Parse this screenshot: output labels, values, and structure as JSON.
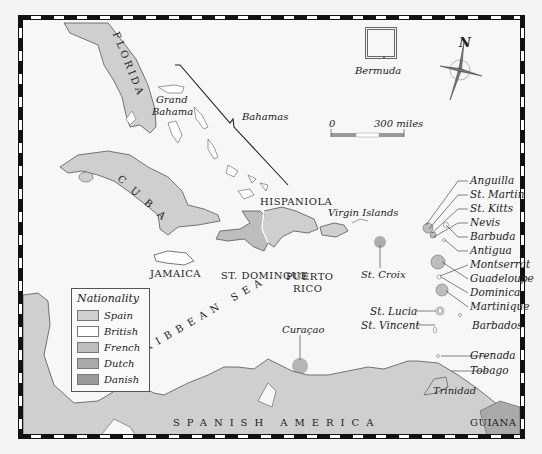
{
  "map": {
    "title": "Caribbean Colonial Nationality Map",
    "regions": {
      "florida": "FLORIDA",
      "cuba": "CUBA",
      "hispaniola": "HISPANIOLA",
      "st_domingue": "ST. DOMINGUE",
      "jamaica": "JAMAICA",
      "puerto_rico_line1": "PUERTO",
      "puerto_rico_line2": "RICO",
      "grand_bahama_line1": "Grand",
      "grand_bahama_line2": "Bahama",
      "bahamas": "Bahamas",
      "bermuda": "Bermuda",
      "virgin_islands": "Virgin Islands",
      "st_croix": "St. Croix",
      "caribbean_sea": "CARIBBEAN SEA",
      "curacao": "Curaçao",
      "spanish_america": "SPANISH AMERICA",
      "guiana": "GUIANA",
      "trinidad": "Trinidad"
    },
    "lesser_antilles": [
      "Anguilla",
      "St. Martin",
      "St. Kitts",
      "Nevis",
      "Barbuda",
      "Antigua",
      "Montserrat",
      "Guadeloupe",
      "Dominica",
      "Martinique"
    ],
    "windward": {
      "st_lucia": "St. Lucia",
      "st_vincent": "St. Vincent",
      "barbados": "Barbados",
      "grenada": "Grenada",
      "tobago": "Tobago"
    },
    "compass": {
      "north_label": "N"
    },
    "scale": {
      "start": "0",
      "end": "300 miles"
    }
  },
  "legend": {
    "title": "Nationality",
    "items": [
      {
        "label": "Spain",
        "color": "#cfcfcf"
      },
      {
        "label": "British",
        "color": "#ffffff"
      },
      {
        "label": "French",
        "color": "#bdbdbd"
      },
      {
        "label": "Dutch",
        "color": "#a9a9a9"
      },
      {
        "label": "Danish",
        "color": "#9a9a9a"
      }
    ]
  },
  "colors": {
    "sea": "#f7f7f7",
    "spain": "#cfcfcf",
    "british": "#ffffff",
    "french": "#bdbdbd",
    "dutch": "#a9a9a9",
    "danish": "#9a9a9a",
    "coast": "#555555"
  }
}
